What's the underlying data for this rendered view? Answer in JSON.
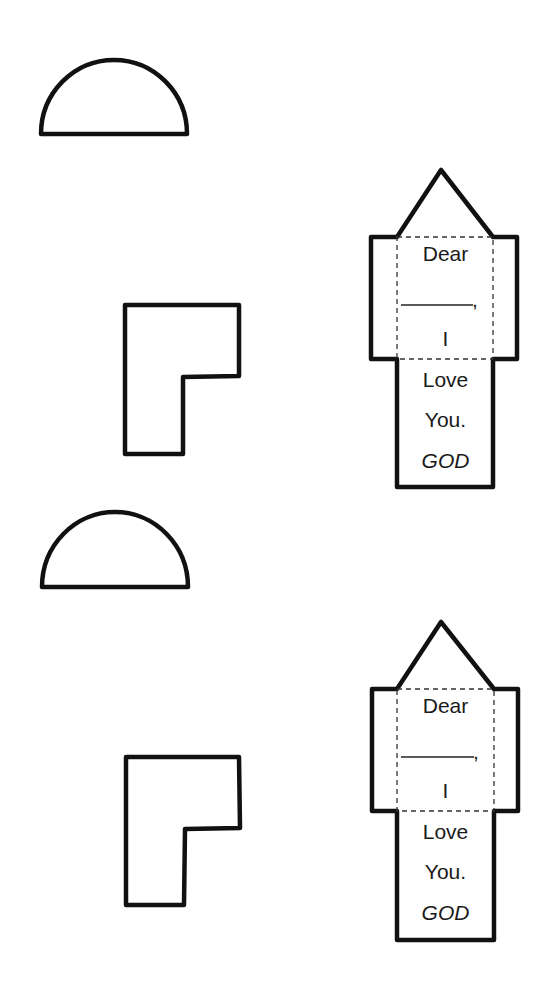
{
  "page": {
    "background": "#ffffff",
    "stroke_color": "#111111"
  },
  "sets": [
    {
      "semicircle": {
        "x1": 41,
        "x2": 187,
        "base_y": 134,
        "top_y": 60
      },
      "l_shape": {
        "points": "125,305 239,305 239,376 183,377 183,454 125,454"
      },
      "house": {
        "apex": [
          441,
          170
        ],
        "lines": {
          "dear": "Dear",
          "blank": "______,",
          "i": "I",
          "love": "Love",
          "you": "You.",
          "signature": "GOD"
        }
      }
    },
    {
      "semicircle": {
        "x1": 42,
        "x2": 188,
        "base_y": 587,
        "top_y": 512
      },
      "l_shape": {
        "points": "126,757 239,757 240,828 185,829 184,905 126,905"
      },
      "house": {
        "apex": [
          441,
          622
        ],
        "lines": {
          "dear": "Dear",
          "blank": "______,",
          "i": "I",
          "love": "Love",
          "you": "You.",
          "signature": "GOD"
        }
      }
    }
  ]
}
